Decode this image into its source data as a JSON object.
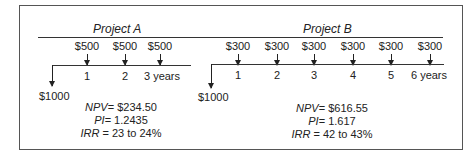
{
  "project_a": {
    "title": "Project A",
    "inflows": [
      "$500",
      "$500",
      "$500"
    ],
    "years": [
      "1",
      "2",
      "3 years"
    ],
    "outflow": "$1000",
    "npv_label": "NPV",
    "npv_value": "= $234.50",
    "pi_label": "PI",
    "pi_value": "= 1.2435",
    "irr_label": "IRR",
    "irr_value": " = 23 to 24%"
  },
  "project_b": {
    "title": "Project B",
    "inflows": [
      "$300",
      "$300",
      "$300",
      "$300",
      "$300",
      "$300"
    ],
    "years": [
      "1",
      "2",
      "3",
      "4",
      "5",
      "6 years"
    ],
    "outflow": "$1000",
    "npv_label": "NPV",
    "npv_value": "= $616.55",
    "pi_label": "PI",
    "pi_value": "= 1.617",
    "irr_label": "IRR",
    "irr_value": " = 42 to 43%"
  }
}
